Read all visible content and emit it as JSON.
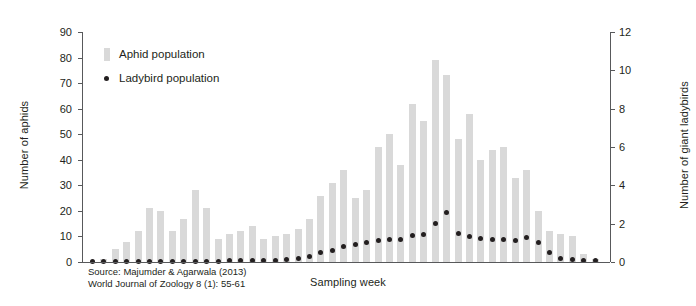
{
  "chart_data": {
    "type": "bar",
    "title": "",
    "xlabel": "Sampling week",
    "ylabel": "Number of aphids",
    "ylabel_right": "Number of giant ladybirds",
    "ylim": [
      0,
      90
    ],
    "ylim_right": [
      0,
      12
    ],
    "yticks": [
      0,
      10,
      20,
      30,
      40,
      50,
      60,
      70,
      80,
      90
    ],
    "yticks_right": [
      0,
      2,
      4,
      6,
      8,
      10,
      12
    ],
    "grid": false,
    "legend_position": "upper-left-inside",
    "categories": [
      1,
      2,
      3,
      4,
      5,
      6,
      7,
      8,
      9,
      10,
      11,
      12,
      13,
      14,
      15,
      16,
      17,
      18,
      19,
      20,
      21,
      22,
      23,
      24,
      25,
      26,
      27,
      28,
      29,
      30,
      31,
      32,
      33,
      34,
      35,
      36,
      37,
      38,
      39,
      40,
      41,
      42,
      43,
      44,
      45
    ],
    "series": [
      {
        "name": "Aphid population",
        "axis": "left",
        "color": "#d9d9d9",
        "marker": "bar",
        "values": [
          0,
          1,
          5,
          8,
          12,
          21,
          20,
          12,
          17,
          28,
          21,
          9,
          11,
          12,
          14,
          9,
          10,
          11,
          13,
          17,
          26,
          31,
          36,
          25,
          28,
          45,
          50,
          38,
          62,
          55,
          79,
          73,
          48,
          58,
          40,
          44,
          45,
          33,
          36,
          20,
          12,
          11,
          10,
          3,
          1
        ]
      },
      {
        "name": "Ladybird population",
        "axis": "right",
        "color": "#231f20",
        "marker": "dot",
        "values": [
          0.05,
          0.05,
          0.05,
          0.05,
          0.05,
          0.05,
          0.05,
          0.05,
          0.05,
          0.05,
          0.05,
          0.05,
          0.1,
          0.1,
          0.1,
          0.1,
          0.1,
          0.15,
          0.2,
          0.3,
          0.5,
          0.6,
          0.8,
          0.9,
          1.0,
          1.1,
          1.15,
          1.2,
          1.4,
          1.45,
          2.0,
          2.6,
          1.5,
          1.35,
          1.25,
          1.2,
          1.15,
          1.1,
          1.3,
          1.0,
          0.5,
          0.2,
          0.15,
          0.1,
          0.1
        ]
      }
    ],
    "annotations": {
      "source_line1": "Source: Majumder & Agarwala (2013)",
      "source_line2": "World Journal of Zoology 8 (1): 55-61"
    }
  }
}
